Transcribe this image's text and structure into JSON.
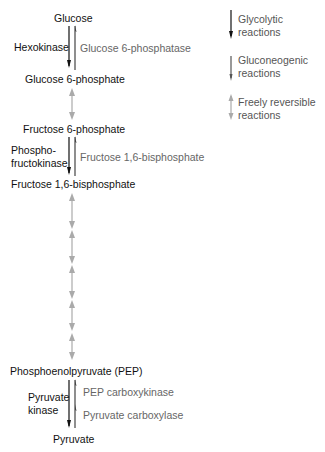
{
  "metabolites": {
    "glucose": "Glucose",
    "g6p": "Glucose 6-phosphate",
    "f6p": "Fructose 6-phosphate",
    "f16bp": "Fructose 1,6-bisphosphate",
    "pep": "Phosphoenolpyruvate (PEP)",
    "pyruvate": "Pyruvate"
  },
  "glycolytic_enzymes": {
    "hexokinase": "Hexokinase",
    "pfk_line1": "Phospho-",
    "pfk_line2": "fructokinase",
    "pk_line1": "Pyruvate",
    "pk_line2": "kinase"
  },
  "gluconeogenic_enzymes": {
    "g6pase": "Glucose 6-phosphatase",
    "fbpase": "Fructose 1,6-bisphosphate",
    "pepck": "PEP carboxykinase",
    "pc": "Pyruvate carboxylase"
  },
  "legend": {
    "glycolytic": {
      "line1": "Glycolytic",
      "line2": "reactions",
      "arrow": "down-arrow-black"
    },
    "gluconeogenic": {
      "line1": "Gluconeogenic",
      "line2": "reactions",
      "arrow": "down-arrow-gray"
    },
    "reversible": {
      "line1": "Freely reversible",
      "line2": "reactions",
      "arrow": "double-arrow-lightgray"
    }
  },
  "colors": {
    "glycolytic": "#111111",
    "gluconeogenic": "#555555",
    "reversible": "#aaaaaa"
  }
}
